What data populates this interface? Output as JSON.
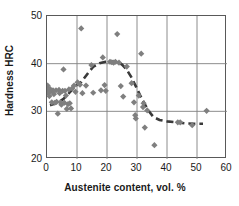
{
  "chart_data": {
    "type": "scatter",
    "title": "",
    "xlabel": "Austenite content, vol. %",
    "ylabel": "Hardness HRC",
    "xlim": [
      0,
      60
    ],
    "ylim": [
      20,
      50
    ],
    "xticks": [
      0,
      10,
      20,
      30,
      40,
      50,
      60
    ],
    "yticks": [
      20,
      30,
      40,
      50
    ],
    "grid": "both",
    "grid_color": "#808080",
    "frame_color": "#595959",
    "marker": "diamond",
    "marker_color": "#7f7f7f",
    "legend": null,
    "trendline": {
      "style": "dashed",
      "color": "#3a3a3a",
      "points": [
        [
          1.0,
          31.3
        ],
        [
          2.5,
          31.6
        ],
        [
          4.0,
          32.0
        ],
        [
          5.5,
          32.6
        ],
        [
          7.0,
          33.6
        ],
        [
          8.5,
          34.6
        ],
        [
          10.0,
          35.6
        ],
        [
          11.5,
          36.2
        ],
        [
          14.0,
          38.3
        ],
        [
          15.5,
          39.4
        ],
        [
          17.5,
          40.1
        ],
        [
          19.5,
          40.4
        ],
        [
          21.5,
          40.5
        ],
        [
          23.5,
          40.4
        ],
        [
          25.0,
          39.8
        ],
        [
          26.5,
          38.8
        ],
        [
          28.0,
          37.3
        ],
        [
          29.5,
          35.4
        ],
        [
          31.0,
          33.4
        ],
        [
          32.5,
          31.6
        ],
        [
          34.0,
          30.0
        ],
        [
          35.5,
          28.8
        ],
        [
          37.5,
          28.2
        ],
        [
          40.0,
          27.9
        ],
        [
          43.0,
          27.7
        ],
        [
          46.0,
          27.5
        ],
        [
          49.0,
          27.4
        ],
        [
          52.0,
          27.4
        ]
      ]
    },
    "points": [
      [
        0.2,
        35.4
      ],
      [
        0.4,
        34.6
      ],
      [
        0.5,
        33.9
      ],
      [
        0.8,
        33.2
      ],
      [
        1.0,
        34.7
      ],
      [
        1.3,
        34.2
      ],
      [
        1.6,
        31.9
      ],
      [
        2.0,
        34.4
      ],
      [
        2.3,
        33.6
      ],
      [
        2.6,
        31.8
      ],
      [
        3.0,
        34.4
      ],
      [
        3.2,
        32.0
      ],
      [
        3.6,
        29.5
      ],
      [
        4.0,
        34.5
      ],
      [
        4.2,
        33.8
      ],
      [
        4.5,
        31.9
      ],
      [
        4.8,
        31.4
      ],
      [
        5.2,
        34.3
      ],
      [
        5.5,
        38.8
      ],
      [
        5.8,
        31.8
      ],
      [
        6.0,
        34.3
      ],
      [
        6.3,
        33.3
      ],
      [
        6.6,
        30.5
      ],
      [
        7.0,
        31.5
      ],
      [
        7.3,
        34.6
      ],
      [
        7.6,
        31.7
      ],
      [
        8.0,
        30.6
      ],
      [
        8.4,
        34.8
      ],
      [
        9.0,
        35.4
      ],
      [
        9.5,
        34.1
      ],
      [
        10.2,
        36.1
      ],
      [
        11.0,
        35.6
      ],
      [
        11.4,
        47.4
      ],
      [
        11.8,
        33.8
      ],
      [
        13.0,
        35.4
      ],
      [
        14.8,
        39.7
      ],
      [
        15.4,
        33.9
      ],
      [
        18.0,
        34.4
      ],
      [
        18.6,
        41.3
      ],
      [
        19.2,
        35.5
      ],
      [
        19.6,
        34.3
      ],
      [
        21.0,
        40.4
      ],
      [
        21.6,
        40.3
      ],
      [
        22.2,
        40.2
      ],
      [
        22.8,
        40.4
      ],
      [
        23.4,
        46.2
      ],
      [
        24.0,
        40.2
      ],
      [
        24.6,
        35.3
      ],
      [
        25.4,
        33.1
      ],
      [
        26.6,
        39.4
      ],
      [
        28.2,
        35.9
      ],
      [
        29.0,
        31.9
      ],
      [
        29.4,
        29.2
      ],
      [
        29.6,
        28.5
      ],
      [
        30.6,
        33.3
      ],
      [
        31.4,
        42.1
      ],
      [
        32.0,
        30.9
      ],
      [
        32.2,
        31.7
      ],
      [
        32.6,
        26.6
      ],
      [
        33.4,
        30.2
      ],
      [
        35.8,
        22.9
      ],
      [
        43.6,
        27.7
      ],
      [
        44.4,
        27.7
      ],
      [
        48.4,
        27.1
      ],
      [
        53.2,
        30.1
      ]
    ]
  }
}
